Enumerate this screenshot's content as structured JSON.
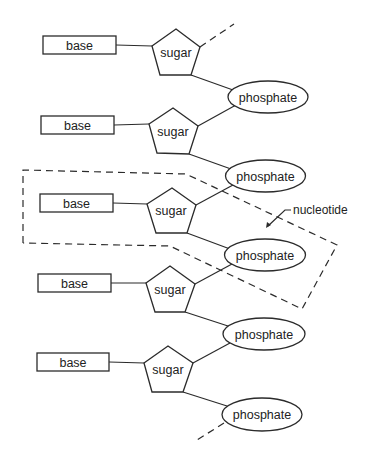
{
  "diagram": {
    "type": "DNA strand backbone schematic",
    "units": [
      {
        "base": "base",
        "sugar": "sugar",
        "phosphate": "phosphate"
      },
      {
        "base": "base",
        "sugar": "sugar",
        "phosphate": "phosphate"
      },
      {
        "base": "base",
        "sugar": "sugar",
        "phosphate": "phosphate"
      },
      {
        "base": "base",
        "sugar": "sugar",
        "phosphate": "phosphate"
      },
      {
        "base": "base",
        "sugar": "sugar",
        "phosphate": "phosphate"
      }
    ],
    "annotation": {
      "label": "nucleotide",
      "highlighted_unit_index": 2
    },
    "colors": {
      "stroke": "#2b2b2b",
      "text": "#222222",
      "background": "#ffffff"
    }
  }
}
